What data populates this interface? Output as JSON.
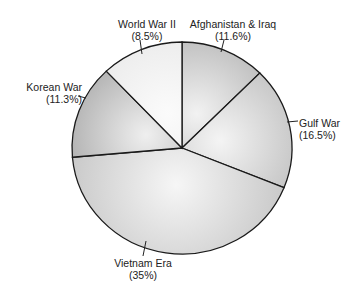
{
  "chart_data": {
    "type": "pie",
    "title": "",
    "slices": [
      {
        "label": "Afghanistan & Iraq",
        "value": 11.6,
        "display": "(11.6%)",
        "start_deg": 0,
        "end_deg": 45,
        "fill_dark": "#a9a9a9",
        "fill_light": "#f2f2f2"
      },
      {
        "label": "Gulf War",
        "value": 16.5,
        "display": "(16.5%)",
        "start_deg": 45,
        "end_deg": 112,
        "fill_dark": "#b5b5b5",
        "fill_light": "#f4f4f4"
      },
      {
        "label": "Vietnam Era",
        "value": 35,
        "display": "(35%)",
        "start_deg": 112,
        "end_deg": 265,
        "fill_dark": "#c8c8c8",
        "fill_light": "#f6f6f6"
      },
      {
        "label": "Korean War",
        "value": 11.3,
        "display": "(11.3%)",
        "start_deg": 265,
        "end_deg": 316.5,
        "fill_dark": "#9a9a9a",
        "fill_light": "#efefef"
      },
      {
        "label": "World War II",
        "value": 8.5,
        "display": "(8.5%)",
        "start_deg": 316.5,
        "end_deg": 360,
        "fill_dark": "#e6e6e6",
        "fill_light": "#fbfbfb"
      }
    ]
  }
}
